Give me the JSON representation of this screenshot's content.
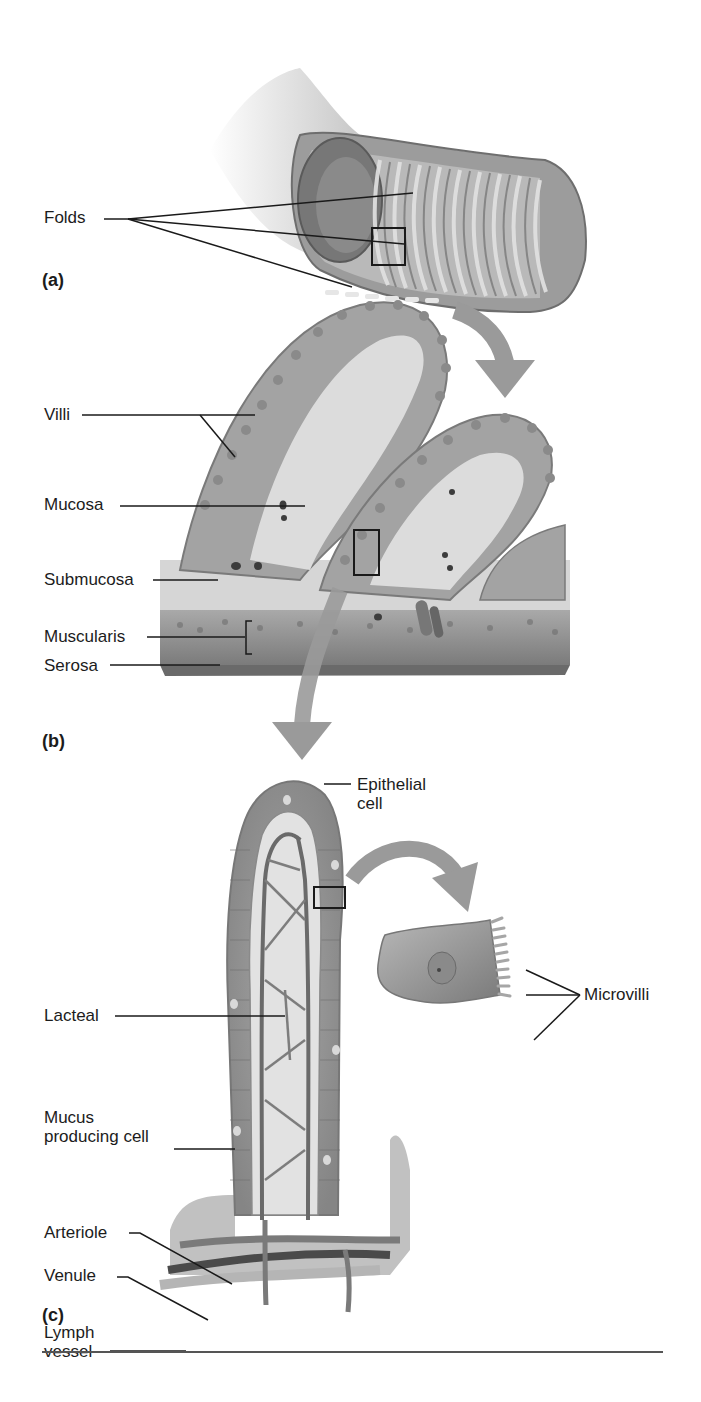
{
  "figure": {
    "panels": [
      {
        "id": "a",
        "label": "(a)",
        "description": "Segment of small intestine cut open showing circular folds",
        "callouts": [
          {
            "text": "Folds"
          }
        ]
      },
      {
        "id": "b",
        "label": "(b)",
        "description": "Section of intestinal wall showing villi and tissue layers",
        "callouts": [
          {
            "text": "Villi"
          },
          {
            "text": "Mucosa"
          },
          {
            "text": "Submucosa"
          },
          {
            "text": "Muscularis"
          },
          {
            "text": "Serosa"
          }
        ]
      },
      {
        "id": "c",
        "label": "(c)",
        "description": "Single villus with lacteal, blood vessels and an enlarged epithelial cell",
        "callouts": [
          {
            "text": "Epithelial",
            "text2": "cell"
          },
          {
            "text": "Lacteal"
          },
          {
            "text": "Microvilli"
          },
          {
            "text": "Mucus",
            "text2": "producing cell"
          },
          {
            "text": "Arteriole"
          },
          {
            "text": "Venule"
          },
          {
            "text": "Lymph",
            "text2": "vessel"
          }
        ]
      }
    ]
  },
  "colors": {
    "tissue_mid": "#8c8c8c",
    "tissue_light": "#c9c9c9",
    "tissue_dark": "#5e5e5e",
    "arrow": "#9a9a9a",
    "leader": "#1a1a1a",
    "rule": "#555555"
  }
}
